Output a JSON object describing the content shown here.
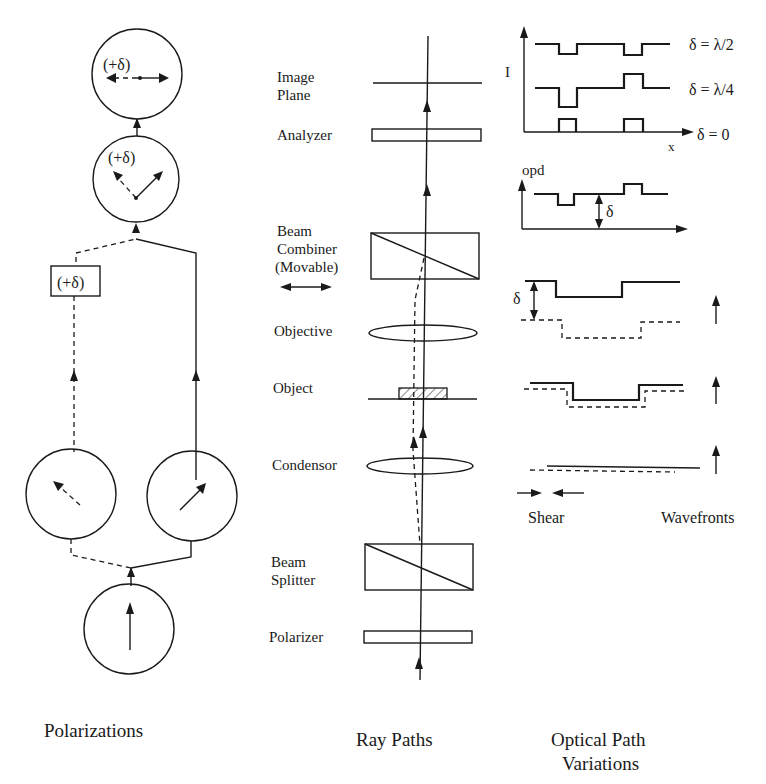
{
  "polarizations": {
    "title": "Polarizations",
    "top_circle_label": "(+δ)",
    "middle_circle_label": "(+δ)",
    "delay_box_label": "(+δ)"
  },
  "ray_paths": {
    "title": "Ray Paths",
    "components": [
      {
        "label_line1": "Image",
        "label_line2": "Plane"
      },
      {
        "label_line1": "Analyzer"
      },
      {
        "label_line1": "Beam",
        "label_line2": "Combiner",
        "label_line3": "(Movable)"
      },
      {
        "label_line1": "Objective"
      },
      {
        "label_line1": "Object"
      },
      {
        "label_line1": "Condensor"
      },
      {
        "label_line1": "Beam",
        "label_line2": "Splitter"
      },
      {
        "label_line1": "Polarizer"
      }
    ]
  },
  "optical_path": {
    "title_line1": "Optical Path",
    "title_line2": "Variations",
    "intensity_axis": "I",
    "x_axis": "x",
    "curves": [
      {
        "label": "δ = λ/2"
      },
      {
        "label": "δ = λ/4"
      },
      {
        "label": "δ = 0"
      }
    ],
    "opd_axis": "opd",
    "opd_delta": "δ",
    "wavefront_delta": "δ",
    "shear_label": "Shear",
    "wavefronts_label": "Wavefronts"
  }
}
